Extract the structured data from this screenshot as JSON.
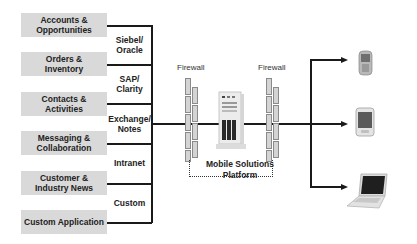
{
  "sources": [
    {
      "label": "Accounts & Opportunities",
      "line1": "Accounts &",
      "line2": "Opportunities"
    },
    {
      "label": "Orders & Inventory",
      "line1": "Orders &",
      "line2": "Inventory"
    },
    {
      "label": "Contacts & Activities",
      "line1": "Contacts &",
      "line2": "Activities"
    },
    {
      "label": "Messaging & Collaboration",
      "line1": "Messaging &",
      "line2": "Collaboration"
    },
    {
      "label": "Customer & Industry News",
      "line1": "Customer &",
      "line2": "Industry News"
    },
    {
      "label": "Custom Application",
      "line1": "Custom Application",
      "line2": ""
    }
  ],
  "systems": [
    {
      "line1": "Siebel/",
      "line2": "Oracle"
    },
    {
      "line1": "SAP/",
      "line2": "Clarity"
    },
    {
      "line1": "Exchange/",
      "line2": "Notes"
    },
    {
      "line1": "Intranet",
      "line2": ""
    },
    {
      "line1": "Custom",
      "line2": ""
    }
  ],
  "firewalls": [
    {
      "label": "Firewall"
    },
    {
      "label": "Firewall"
    }
  ],
  "platform": {
    "line1": "Mobile Solutions",
    "line2": "Platform"
  },
  "devices": [
    {
      "name": "mobile-phone"
    },
    {
      "name": "pda"
    },
    {
      "name": "laptop"
    }
  ],
  "colors": {
    "box_fill": "#d9d9d9",
    "line": "#1a1a1a",
    "brick_fill": "#d4d4d4"
  }
}
